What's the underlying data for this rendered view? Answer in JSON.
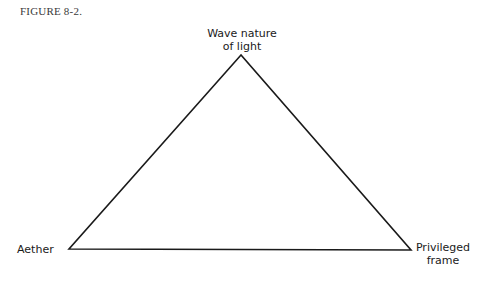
{
  "figure": {
    "label": "FIGURE 8-2."
  },
  "diagram": {
    "type": "triangle",
    "stroke_color": "#1a1a1a",
    "vertices": [
      {
        "id": "top",
        "x": 241,
        "y": 55,
        "label_line1": "Wave nature",
        "label_line2": "of light"
      },
      {
        "id": "left",
        "x": 69,
        "y": 249,
        "label_line1": "Aether"
      },
      {
        "id": "right",
        "x": 411,
        "y": 250,
        "label_line1": "Privileged",
        "label_line2": "frame"
      }
    ]
  }
}
